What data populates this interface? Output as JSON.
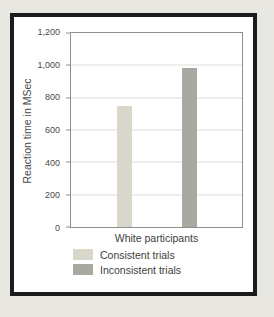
{
  "background_color": "#e9e7e1",
  "frame_border_color": "#1c1c1c",
  "chart_data": {
    "type": "bar",
    "categories": [
      "White participants"
    ],
    "series": [
      {
        "name": "Consistent trials",
        "values": [
          750
        ],
        "color": "#d9d6ca"
      },
      {
        "name": "Inconsistent trials",
        "values": [
          985
        ],
        "color": "#a9a9a1"
      }
    ],
    "title": "",
    "xlabel": "White participants",
    "ylabel": "Reaction time in MSec",
    "ylim": [
      0,
      1200
    ],
    "yticks": [
      0,
      200,
      400,
      600,
      800,
      1000,
      1200
    ],
    "ytick_labels": [
      "0",
      "200",
      "400",
      "600",
      "800",
      "1,000",
      "1,200"
    ],
    "grid": true,
    "legend_position": "bottom-left"
  }
}
